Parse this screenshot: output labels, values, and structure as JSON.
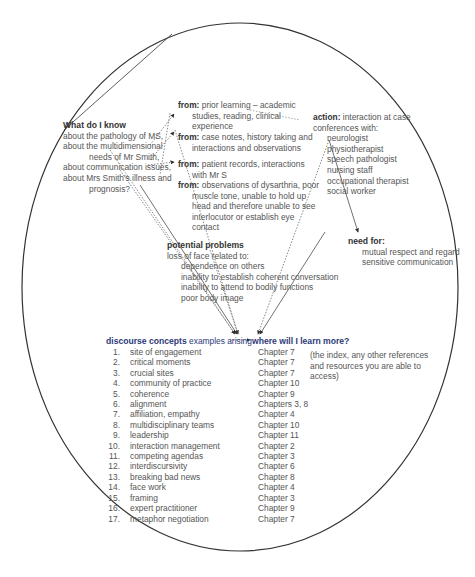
{
  "diagram": {
    "shape": "ellipse",
    "know": {
      "heading": "What do I know",
      "lines": [
        "about the pathology of MS,",
        "about the multidimensional",
        "needs of Mr Smith,",
        "about communication issues,",
        "about Mrs Smith's illness and",
        "prognosis?"
      ]
    },
    "sources": [
      {
        "label": "from:",
        "lines": [
          "prior learning – academic",
          "studies, reading, clinical",
          "experience"
        ]
      },
      {
        "label": "from:",
        "lines": [
          "case notes, history taking and",
          "interactions and observations"
        ]
      },
      {
        "label": "from:",
        "lines": [
          "patient records, interactions",
          "with Mr S"
        ]
      },
      {
        "label": "from:",
        "lines": [
          "observations of dysarthria, poor",
          "muscle tone, unable to hold up",
          "head and therefore unable to see",
          "interlocutor or establish eye",
          "contact"
        ]
      }
    ],
    "action": {
      "label": "action:",
      "first_line": "interaction at case",
      "second_line": "conferences with:",
      "participants": [
        "neurologist",
        "physiotherapist",
        "speech pathologist",
        "nursing staff",
        "occupational therapist",
        "social worker"
      ]
    },
    "problems": {
      "heading": "potential problems",
      "intro": "loss of face related to:",
      "items": [
        "dependence on others",
        "inability to establish coherent conversation",
        "inability to attend to bodily functions",
        "poor body image"
      ]
    },
    "need": {
      "label": "need for:",
      "lines": [
        "mutual respect and regard",
        "sensitive communication"
      ]
    },
    "concepts": {
      "heading_bold": "discourse concepts",
      "heading_rest": "examples arising",
      "learn_heading_bold": "where will",
      "learn_heading_rest": "I learn more?",
      "note_lines": [
        "(the index, any other references",
        "and resources you are able to",
        "access)"
      ],
      "items": [
        {
          "n": "1.",
          "term": "site of engagement",
          "ref": "Chapter 7"
        },
        {
          "n": "2.",
          "term": "critical moments",
          "ref": "Chapter 7"
        },
        {
          "n": "3.",
          "term": "crucial sites",
          "ref": "Chapter 7"
        },
        {
          "n": "4.",
          "term": "community of practice",
          "ref": "Chapter 10"
        },
        {
          "n": "5.",
          "term": "coherence",
          "ref": "Chapter 9"
        },
        {
          "n": "6.",
          "term": "alignment",
          "ref": "Chapters 3, 8"
        },
        {
          "n": "7.",
          "term": "affiliation, empathy",
          "ref": "Chapter 4"
        },
        {
          "n": "8.",
          "term": "multidisciplinary teams",
          "ref": "Chapter 10"
        },
        {
          "n": "9.",
          "term": "leadership",
          "ref": "Chapter 11"
        },
        {
          "n": "10.",
          "term": "interaction management",
          "ref": "Chapter 2"
        },
        {
          "n": "11.",
          "term": "competing agendas",
          "ref": "Chapter 3"
        },
        {
          "n": "12.",
          "term": "interdiscursivity",
          "ref": "Chapter 6"
        },
        {
          "n": "13.",
          "term": "breaking bad news",
          "ref": "Chapter 8"
        },
        {
          "n": "14.",
          "term": "face work",
          "ref": "Chapter 4"
        },
        {
          "n": "15.",
          "term": "framing",
          "ref": "Chapter 3"
        },
        {
          "n": "16.",
          "term": "expert practitioner",
          "ref": "Chapter 9"
        },
        {
          "n": "17.",
          "term": "metaphor negotiation",
          "ref": "Chapter 7"
        }
      ]
    },
    "colors": {
      "outline": "#333333",
      "text": "#555555",
      "heading_blue": "#2d3a78"
    }
  }
}
